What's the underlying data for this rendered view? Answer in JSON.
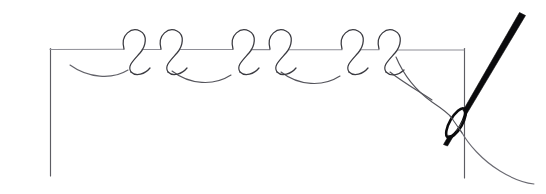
{
  "illustration": {
    "title": "Knotted line stitch worked on a guide line with needle and thread",
    "kind": "line-drawing",
    "medium": "pen and ink diagram",
    "background_color": "#ffffff",
    "ink_color": "#3a3a40",
    "needle_color": "#0a0a0c",
    "guide_color": "#5d5d63",
    "canvas": {
      "width": 546,
      "height": 194
    }
  },
  "guides": {
    "corner_frame_label": "fabric guide lines",
    "left_vertical": {
      "x": 50,
      "y_top": 48,
      "y_bottom": 176
    },
    "right_vertical": {
      "x": 464,
      "y_top": 48,
      "y_bottom": 178
    },
    "horizontal_baseline": {
      "y": 50,
      "x_start": 50,
      "x_end": 464
    }
  },
  "stitch": {
    "name": "knotted stitch row",
    "knot_count": 6,
    "knot_pair_count": 3,
    "scallop_count": 4,
    "knot_centers_x": [
      131,
      168,
      240,
      277,
      349,
      386
    ],
    "direction": "left to right"
  },
  "needle": {
    "name": "sewing needle",
    "angle_label": "tilted up-right",
    "tip_x": 444,
    "tip_y": 143,
    "top_x": 522,
    "top_y": 14,
    "eye_center_x": 456,
    "eye_center_y": 123,
    "has_thread_through_eye": true
  },
  "thread": {
    "name": "working thread",
    "tail_label": "loose thread tail",
    "tail_end_x": 534,
    "tail_end_y": 183
  }
}
